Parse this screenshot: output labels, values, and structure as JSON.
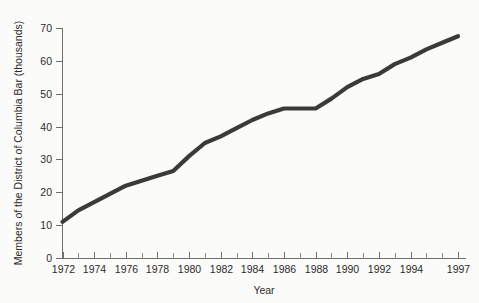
{
  "chart_data": {
    "type": "line",
    "title": "",
    "xlabel": "Year",
    "ylabel": "Members of the District of Columbia Bar (thousands)",
    "xlim": [
      1972,
      1997
    ],
    "ylim": [
      0,
      70
    ],
    "grid": false,
    "legend": null,
    "y_ticks": [
      0,
      10,
      20,
      30,
      40,
      50,
      60,
      70
    ],
    "y_tick_labels": [
      "0",
      "10",
      "20",
      "30",
      "40",
      "50",
      "60",
      "70"
    ],
    "x_ticks": [
      1972,
      1974,
      1976,
      1978,
      1980,
      1982,
      1984,
      1986,
      1988,
      1990,
      1992,
      1994,
      1997
    ],
    "x_tick_labels": [
      "1972",
      "1974",
      "1976",
      "1978",
      "1980",
      "1982",
      "1984",
      "1986",
      "1988",
      "1990",
      "1992",
      "1994",
      "1997"
    ],
    "x_minor_ticks": [
      1973,
      1975,
      1977,
      1979,
      1981,
      1983,
      1985,
      1987,
      1989,
      1991,
      1993,
      1995,
      1996
    ],
    "series": [
      {
        "name": "Members of the District of Columbia Bar",
        "color": "#3a3a3a",
        "x": [
          1972,
          1973,
          1974,
          1975,
          1976,
          1977,
          1978,
          1979,
          1980,
          1981,
          1982,
          1983,
          1984,
          1985,
          1986,
          1987,
          1988,
          1989,
          1990,
          1991,
          1992,
          1993,
          1994,
          1995,
          1996,
          1997
        ],
        "values": [
          11,
          14.5,
          17,
          19.5,
          22,
          23.5,
          25,
          26.5,
          31,
          35,
          37,
          39.5,
          42,
          44,
          45.5,
          45.5,
          45.5,
          48.5,
          52,
          54.5,
          56,
          59,
          61,
          63.5,
          65.5,
          67.5
        ]
      }
    ]
  },
  "axis": {
    "y_label_text": "Members of the District of Columbia Bar (thousands)",
    "x_label_text": "Year"
  }
}
